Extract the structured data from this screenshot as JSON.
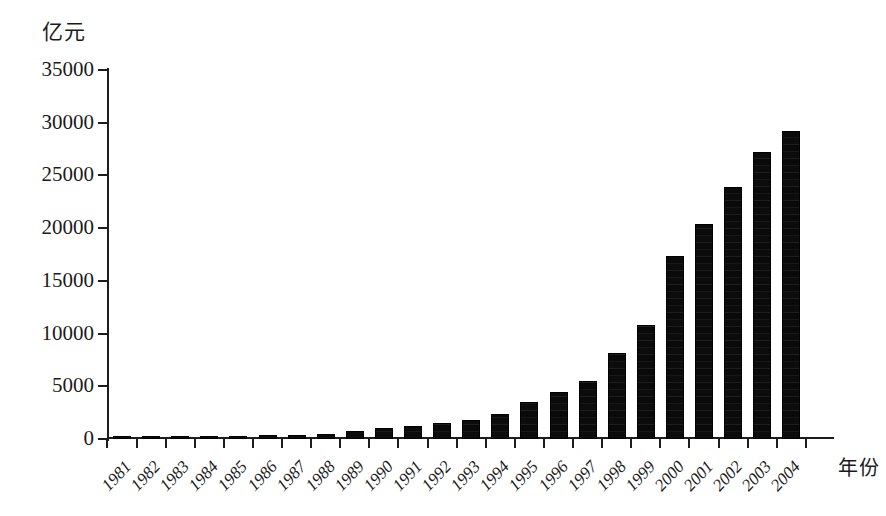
{
  "chart_data": {
    "type": "bar",
    "title": "",
    "ylabel": "亿元",
    "xlabel": "年份",
    "ylim": [
      0,
      35000
    ],
    "ytick_values": [
      0,
      5000,
      10000,
      15000,
      20000,
      25000,
      30000,
      35000
    ],
    "ytick_labels": [
      "0",
      "5000",
      "10000",
      "15000",
      "20000",
      "25000",
      "30000",
      "35000"
    ],
    "grid": false,
    "legend": null,
    "categories": [
      "1981",
      "1982",
      "1983",
      "1984",
      "1985",
      "1986",
      "1987",
      "1988",
      "1989",
      "1990",
      "1991",
      "1992",
      "1993",
      "1994",
      "1995",
      "1996",
      "1997",
      "1998",
      "1999",
      "2000",
      "2001",
      "2002",
      "2003",
      "2004"
    ],
    "values": [
      100,
      150,
      200,
      250,
      300,
      350,
      400,
      500,
      800,
      1050,
      1250,
      1550,
      1800,
      2350,
      3500,
      4450,
      5550,
      8150,
      10800,
      17400,
      20400,
      23900,
      27200,
      29200
    ],
    "series": [
      {
        "name": "亿元",
        "values": [
          100,
          150,
          200,
          250,
          300,
          350,
          400,
          500,
          800,
          1050,
          1250,
          1550,
          1800,
          2350,
          3500,
          4450,
          5550,
          8150,
          10800,
          17400,
          20400,
          23900,
          27200,
          29200
        ]
      }
    ],
    "bar_color": "#0d0d0d"
  }
}
